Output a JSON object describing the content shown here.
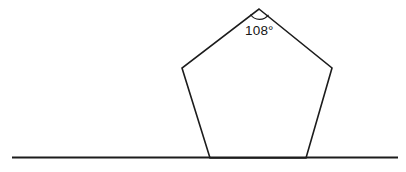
{
  "figure": {
    "background_color": "#ffffff",
    "stroke_color": "#1c1c1c",
    "width": 406,
    "height": 172
  },
  "baseline": {
    "name": "horizontal-ground-line",
    "x1": 12,
    "y1": 157.5,
    "x2": 398,
    "y2": 157.5,
    "stroke_width": 2,
    "color": "#1c1c1c"
  },
  "pentagon": {
    "name": "pentagon",
    "sides": 5,
    "fill": "none",
    "stroke_width": 1.6,
    "color": "#1c1c1c",
    "vertices": [
      {
        "label": "apex",
        "x": 259,
        "y": 9
      },
      {
        "label": "upper-right",
        "x": 332,
        "y": 68
      },
      {
        "label": "lower-right",
        "x": 306,
        "y": 158
      },
      {
        "label": "lower-left",
        "x": 210,
        "y": 158
      },
      {
        "label": "upper-left",
        "x": 182,
        "y": 68
      }
    ],
    "points_attr": "259,9 332,68 306,158 210,158 182,68"
  },
  "angle_marker": {
    "name": "angle-arc",
    "vertex": {
      "x": 259,
      "y": 9
    },
    "arc_path": "M 250.5 14.5 A 11 11 0 0 0 268.5 14.8",
    "stroke_width": 1.2,
    "color": "#1c1c1c"
  },
  "angle_label": {
    "name": "angle-label",
    "value": "108",
    "unit": "°",
    "text": "108°",
    "x": 245,
    "y": 35,
    "color": "#161616",
    "font_size_px": 13.5
  }
}
